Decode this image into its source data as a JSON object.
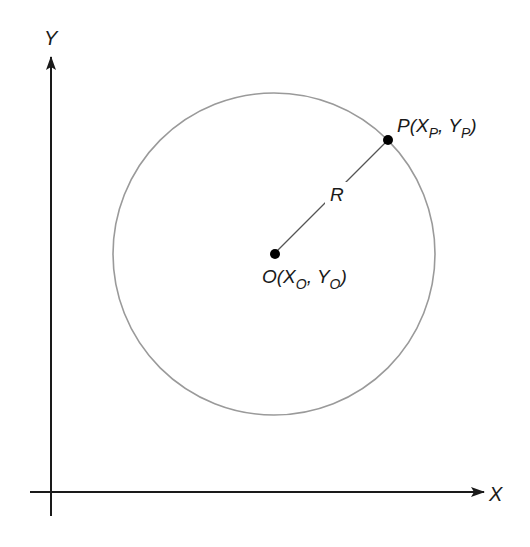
{
  "diagram": {
    "axes": {
      "x_label": "X",
      "y_label": "Y",
      "color": "#1a1a1a"
    },
    "circle": {
      "color": "#9a9a9a",
      "radius_label": "R"
    },
    "points": {
      "center": {
        "name": "O",
        "open": "O(X",
        "sub1": "O",
        "mid": ", Y",
        "sub2": "O",
        "close": ")"
      },
      "perimeter": {
        "name": "P",
        "open": "P(X",
        "sub1": "P",
        "mid": ", Y",
        "sub2": "P",
        "close": ")"
      }
    },
    "radius_line_color": "#555555",
    "point_color": "#000000"
  }
}
